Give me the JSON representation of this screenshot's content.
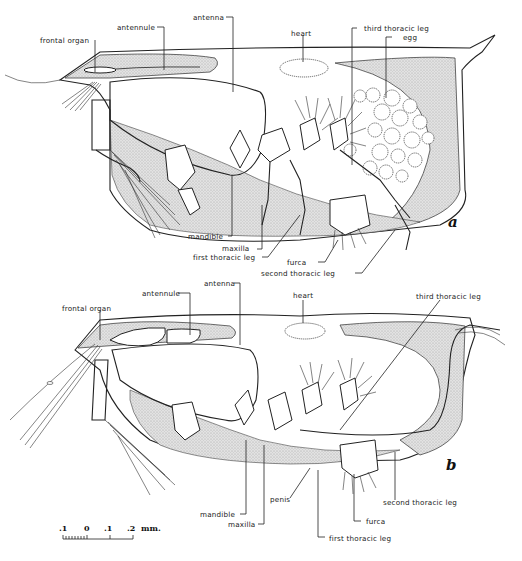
{
  "figure": {
    "panels": [
      {
        "id": "a",
        "label": "a",
        "annotations": {
          "frontal_organ": "frontal organ",
          "antennule": "antennule",
          "antenna": "antenna",
          "heart": "heart",
          "third_thoracic_leg": "third thoracic leg",
          "egg": "egg",
          "mandible": "mandible",
          "maxilla": "maxilla",
          "first_thoracic_leg": "first thoracic leg",
          "furca": "furca",
          "second_thoracic_leg": "second thoracic leg"
        }
      },
      {
        "id": "b",
        "label": "b",
        "annotations": {
          "frontal_organ": "frontal organ",
          "antennule": "antennule",
          "antenna": "antenna",
          "heart": "heart",
          "third_thoracic_leg": "third thoracic leg",
          "second_thoracic_leg": "second thoracic leg",
          "mandible": "mandible",
          "maxilla": "maxilla",
          "penis": "penis",
          "furca": "furca",
          "first_thoracic_leg": "first thoracic leg"
        }
      }
    ],
    "scale_bar": {
      "ticks": [
        ".1",
        "0",
        ".1",
        ".2"
      ],
      "unit": "mm."
    }
  }
}
